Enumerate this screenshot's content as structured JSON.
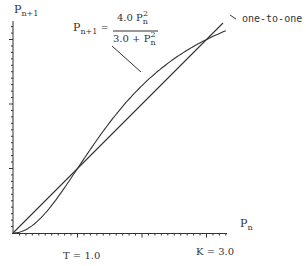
{
  "chart_data": {
    "type": "line",
    "title": "",
    "xlabel": "P_n",
    "ylabel": "P_{n+1}",
    "xlim": [
      0,
      3.3
    ],
    "ylim": [
      0,
      3.3
    ],
    "grid": false,
    "series": [
      {
        "name": "P_{n+1} = 4.0 P_n^2 / (3.0 + P_n^2)",
        "x": [
          0,
          0.25,
          0.5,
          0.75,
          1.0,
          1.5,
          2.0,
          2.5,
          3.0,
          3.3
        ],
        "y": [
          0,
          0.082,
          0.308,
          0.632,
          1.0,
          1.714,
          2.286,
          2.703,
          3.0,
          3.136
        ]
      },
      {
        "name": "one-to-one",
        "x": [
          0,
          1.0,
          2.0,
          3.0,
          3.25
        ],
        "y": [
          0,
          1.0,
          2.0,
          3.0,
          3.25
        ]
      }
    ],
    "annotations": [
      "T = 1.0",
      "K = 3.0",
      "one-to-one"
    ],
    "fixed_points": [
      0,
      1.0,
      3.0
    ]
  },
  "labels": {
    "y_axis": {
      "main": "P",
      "sub": "n+1"
    },
    "x_axis": {
      "main": "P",
      "sub": "n"
    },
    "equation": {
      "lhs_main": "P",
      "lhs_sub": "n+1",
      "equals": "=",
      "num_coef": "4.0 P",
      "num_sup": "2",
      "num_sub": "n",
      "den_coef": "3.0 + P",
      "den_sup": "2",
      "den_sub": "n"
    },
    "one_to_one": "one-to-one",
    "threshold": "T  = 1.0",
    "capacity": "K = 3.0"
  },
  "colors": {
    "ink": "#333333",
    "background": "#ffffff"
  }
}
